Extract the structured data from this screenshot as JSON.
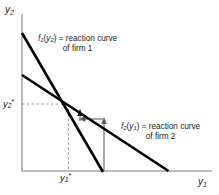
{
  "figure": {
    "axes": {
      "y_axis_label": "y2",
      "x_axis_label": "y1",
      "y_tick_label": "y2*",
      "x_tick_label": "y1*"
    },
    "annotations": {
      "curve1_line1": "f1(y2) = reaction curve",
      "curve1_line2": "of firm 1",
      "curve2_line1": "f2(y1) = reaction curve",
      "curve2_line2": "of firm 2"
    },
    "colors": {
      "curve": "#000000",
      "axis": "#a8a8a8",
      "guide": "#9a9a9a",
      "arrow": "#8c8c8c",
      "text": "#1a1a1a",
      "background": "#ffffff"
    }
  },
  "chart_data": {
    "type": "line",
    "xlabel": "y1",
    "ylabel": "y2",
    "grid": false,
    "legend": "inline-annotations",
    "axis_origin_px": [
      22,
      171
    ],
    "xlim_px": [
      22,
      210
    ],
    "ylim_px": [
      171,
      14
    ],
    "equilibrium_point_px": [
      68,
      104
    ],
    "equilibrium_labels": {
      "x": "y1*",
      "y": "y2*"
    },
    "series": [
      {
        "name": "f1(y2) = reaction curve of firm 1",
        "role": "firm-1-reaction-curve",
        "slope": "steep",
        "points_px": [
          [
            22,
            33
          ],
          [
            103,
            171
          ]
        ]
      },
      {
        "name": "f2(y1) = reaction curve of firm 2",
        "role": "firm-2-reaction-curve",
        "slope": "shallow",
        "points_px": [
          [
            22,
            75
          ],
          [
            168,
            171
          ]
        ]
      }
    ],
    "convergence_path": {
      "description": "cobweb staircase arrows converging to the equilibrium point",
      "segments_px": [
        {
          "from": [
            104,
            171
          ],
          "to": [
            104,
            119
          ],
          "direction": "up"
        },
        {
          "from": [
            104,
            119
          ],
          "to": [
            80,
            119
          ],
          "direction": "left"
        },
        {
          "from": [
            80,
            119
          ],
          "to": [
            80,
            110
          ],
          "direction": "up"
        }
      ]
    },
    "guides_px": [
      {
        "from": [
          22,
          104
        ],
        "to": [
          68,
          104
        ],
        "style": "dashed"
      },
      {
        "from": [
          68,
          104
        ],
        "to": [
          68,
          171
        ],
        "style": "dashed"
      }
    ]
  }
}
